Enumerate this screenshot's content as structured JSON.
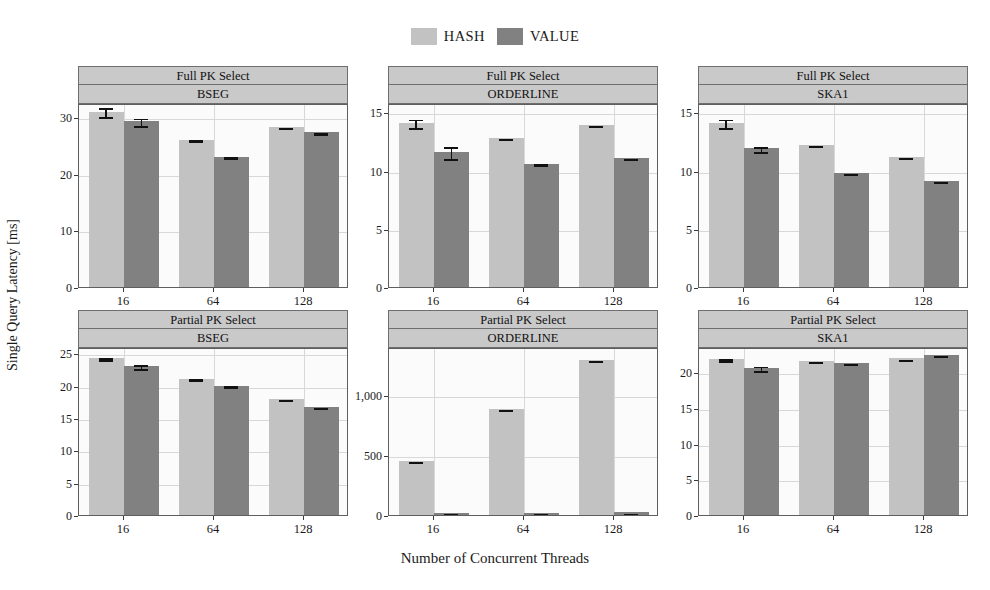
{
  "legend": {
    "items": [
      {
        "label": "HASH",
        "color": "#c2c2c2"
      },
      {
        "label": "VALUE",
        "color": "#818181"
      }
    ]
  },
  "axes": {
    "ylabel": "Single Query Latency [ms]",
    "xlabel": "Number of Concurrent Threads"
  },
  "chart_data": {
    "type": "bar",
    "title": "",
    "xlabel": "Number of Concurrent Threads",
    "ylabel": "Single Query Latency [ms]",
    "grid": true,
    "legend_position": "top-center",
    "categories": [
      "16",
      "64",
      "128"
    ],
    "series_names": [
      "HASH",
      "VALUE"
    ],
    "facet_rows": [
      "Full PK Select",
      "Partial PK Select"
    ],
    "facet_cols": [
      "BSEG",
      "ORDERLINE",
      "SKA1"
    ],
    "panels": [
      {
        "row_label": "Full PK Select",
        "col_label": "BSEG",
        "ylim": [
          0,
          32.5
        ],
        "yticks": [
          0,
          10,
          20,
          30
        ],
        "ytick_labels": [
          "0",
          "10",
          "20",
          "30"
        ],
        "series": [
          {
            "name": "HASH",
            "values": [
              31.0,
              26.0,
              28.3
            ],
            "errors": [
              0.9,
              0.25,
              0.15
            ]
          },
          {
            "name": "VALUE",
            "values": [
              29.3,
              23.0,
              27.3
            ],
            "errors": [
              0.8,
              0.3,
              0.2
            ]
          }
        ]
      },
      {
        "row_label": "Full PK Select",
        "col_label": "ORDERLINE",
        "ylim": [
          0,
          15.8
        ],
        "yticks": [
          0,
          5,
          10,
          15
        ],
        "ytick_labels": [
          "0",
          "5",
          "10",
          "15"
        ],
        "series": [
          {
            "name": "HASH",
            "values": [
              14.1,
              12.8,
              13.9
            ],
            "errors": [
              0.45,
              0.12,
              0.1
            ]
          },
          {
            "name": "VALUE",
            "values": [
              11.6,
              10.6,
              11.1
            ],
            "errors": [
              0.6,
              0.12,
              0.1
            ]
          }
        ]
      },
      {
        "row_label": "Full PK Select",
        "col_label": "SKA1",
        "ylim": [
          0,
          15.8
        ],
        "yticks": [
          0,
          5,
          10,
          15
        ],
        "ytick_labels": [
          "0",
          "5",
          "10",
          "15"
        ],
        "series": [
          {
            "name": "HASH",
            "values": [
              14.1,
              12.2,
              11.2
            ],
            "errors": [
              0.45,
              0.1,
              0.08
            ]
          },
          {
            "name": "VALUE",
            "values": [
              11.9,
              9.8,
              9.1
            ],
            "errors": [
              0.3,
              0.1,
              0.1
            ]
          }
        ]
      },
      {
        "row_label": "Partial PK Select",
        "col_label": "BSEG",
        "ylim": [
          0,
          26.0
        ],
        "yticks": [
          0,
          5,
          10,
          15,
          20,
          25
        ],
        "ytick_labels": [
          "0",
          "5",
          "10",
          "15",
          "20",
          "25"
        ],
        "series": [
          {
            "name": "HASH",
            "values": [
              24.3,
              21.1,
              18.0
            ],
            "errors": [
              0.3,
              0.2,
              0.12
            ]
          },
          {
            "name": "VALUE",
            "values": [
              23.0,
              20.0,
              16.7
            ],
            "errors": [
              0.45,
              0.2,
              0.15
            ]
          }
        ]
      },
      {
        "row_label": "Partial PK Select",
        "col_label": "ORDERLINE",
        "ylim": [
          0,
          1400
        ],
        "yticks": [
          0,
          500,
          1000
        ],
        "ytick_labels": [
          "0",
          "500",
          "1,000"
        ],
        "series": [
          {
            "name": "HASH",
            "values": [
              450,
              880,
              1290
            ],
            "errors": [
              8,
              8,
              8
            ]
          },
          {
            "name": "VALUE",
            "values": [
              18,
              20,
              22
            ],
            "errors": [
              4,
              4,
              4
            ]
          }
        ]
      },
      {
        "row_label": "Partial PK Select",
        "col_label": "SKA1",
        "ylim": [
          0,
          23.5
        ],
        "yticks": [
          0,
          5,
          10,
          15,
          20
        ],
        "ytick_labels": [
          "0",
          "5",
          "10",
          "15",
          "20"
        ],
        "series": [
          {
            "name": "HASH",
            "values": [
              21.8,
              21.5,
              21.9
            ],
            "errors": [
              0.3,
              0.12,
              0.12
            ]
          },
          {
            "name": "VALUE",
            "values": [
              20.6,
              21.3,
              22.4
            ],
            "errors": [
              0.45,
              0.15,
              0.12
            ]
          }
        ]
      }
    ]
  }
}
